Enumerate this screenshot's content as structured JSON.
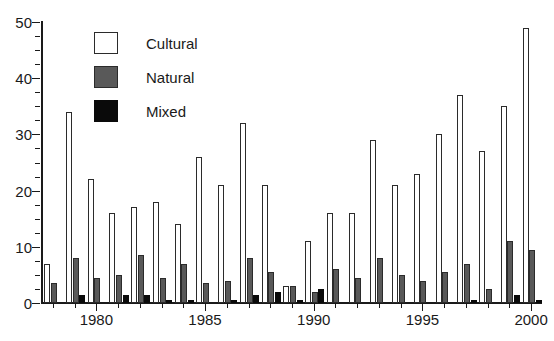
{
  "chart_data": {
    "type": "bar",
    "title": "",
    "subtitle": "",
    "xlabel": "",
    "ylabel": "",
    "ylim": [
      0,
      50
    ],
    "ytick_values": [
      0,
      10,
      20,
      30,
      40,
      50
    ],
    "ytick_labels": [
      "0",
      "10",
      "20",
      "30",
      "40",
      "50"
    ],
    "yminor_step": 2.5,
    "grid": false,
    "legend_position": "upper-left-inside",
    "categories": [
      "1978",
      "1979",
      "1980",
      "1981",
      "1982",
      "1983",
      "1984",
      "1985",
      "1986",
      "1987",
      "1988",
      "1989",
      "1990",
      "1991",
      "1992",
      "1993",
      "1994",
      "1995",
      "1996",
      "1997",
      "1998",
      "1999",
      "2000"
    ],
    "xtick_labels": [
      "1980",
      "1985",
      "1990",
      "1995",
      "2000"
    ],
    "xtick_categories": [
      "1980",
      "1985",
      "1990",
      "1995",
      "2000"
    ],
    "series": [
      {
        "name": "Cultural",
        "color": "#ffffff",
        "edge_color": "#2b2b2b",
        "values": [
          7,
          34,
          22,
          16,
          17,
          18,
          14,
          26,
          21,
          32,
          21,
          3,
          11,
          16,
          16,
          29,
          21,
          23,
          30,
          37,
          27,
          35,
          49
        ]
      },
      {
        "name": "Natural",
        "color": "#595959",
        "edge_color": "#2b2b2b",
        "values": [
          3.5,
          8,
          4.5,
          5,
          8.5,
          4.5,
          7,
          3.5,
          4,
          8,
          5.5,
          3,
          2,
          6,
          4.5,
          8,
          5,
          4,
          5.5,
          7,
          2.5,
          11,
          9.5
        ]
      },
      {
        "name": "Mixed",
        "color": "#0a0a0a",
        "edge_color": "#0a0a0a",
        "values": [
          0,
          1.5,
          0,
          1.5,
          1.5,
          0.5,
          0.5,
          0,
          0.5,
          1.5,
          2,
          0.5,
          2.5,
          0,
          0,
          0,
          0,
          0,
          0,
          0.5,
          0,
          1.5,
          0.5
        ]
      }
    ]
  },
  "legend": {
    "items": [
      {
        "label": "Cultural",
        "swatch": "cultural-swatch"
      },
      {
        "label": "Natural",
        "swatch": "natural-swatch"
      },
      {
        "label": "Mixed",
        "swatch": "mixed-swatch"
      }
    ]
  },
  "colors": {
    "cultural": "#ffffff",
    "natural": "#595959",
    "mixed": "#0a0a0a",
    "axis": "#1a1a1a",
    "background": "#ffffff"
  }
}
